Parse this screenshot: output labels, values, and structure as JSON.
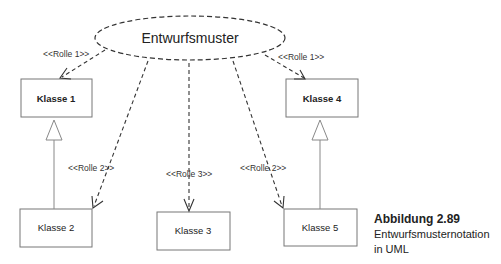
{
  "diagram": {
    "pattern": {
      "label": "Entwurfsmuster"
    },
    "classes": [
      {
        "id": "k1",
        "label": "Klasse 1"
      },
      {
        "id": "k2",
        "label": "Klasse 2"
      },
      {
        "id": "k3",
        "label": "Klasse 3"
      },
      {
        "id": "k4",
        "label": "Klasse 4"
      },
      {
        "id": "k5",
        "label": "Klasse 5"
      }
    ],
    "roles": [
      {
        "to": "k1",
        "label": "<<Rolle 1>>"
      },
      {
        "to": "k4",
        "label": "<<Rolle 1>>"
      },
      {
        "to": "k2",
        "label": "<<Rolle 2>>"
      },
      {
        "to": "k5",
        "label": "<<Rolle 2>>"
      },
      {
        "to": "k3",
        "label": "<<Rolle 3>>"
      }
    ],
    "generalizations": [
      {
        "from": "k2",
        "to": "k1"
      },
      {
        "from": "k5",
        "to": "k4"
      }
    ]
  },
  "caption": {
    "title": "Abbildung 2.89",
    "line1": "Entwurfsmusternotation",
    "line2": "in UML"
  },
  "colors": {
    "line": "#333333",
    "box": "#777777",
    "text": "#222222"
  }
}
